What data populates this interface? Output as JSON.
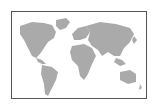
{
  "image": {
    "subject": "world-map-icon",
    "land_color": "#aaaaaa",
    "frame_color": "#555555",
    "background": "#ffffff"
  }
}
